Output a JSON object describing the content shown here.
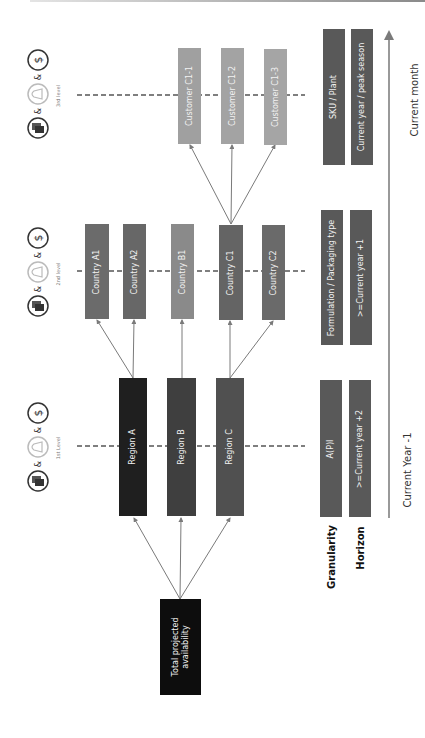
{
  "diagram": {
    "root": {
      "label": "Total projected availability",
      "color": "#0d0d0d"
    },
    "levels": [
      {
        "label": "1st Level",
        "icons": [
          "money-icon",
          "bell-icon",
          "containers-icon"
        ],
        "connector": "&"
      },
      {
        "label": "2nd level",
        "icons": [
          "money-icon",
          "bell-icon",
          "containers-icon"
        ],
        "connector": "&"
      },
      {
        "label": "3rd level",
        "icons": [
          "money-icon",
          "bell-icon",
          "containers-icon"
        ],
        "connector": "&"
      }
    ],
    "regions": [
      {
        "label": "Region A",
        "color": "#1f1f1f"
      },
      {
        "label": "Region B",
        "color": "#3f3f3f"
      },
      {
        "label": "Region C",
        "color": "#505050"
      }
    ],
    "countries": [
      {
        "label": "Country A1",
        "color": "#6b6b6b"
      },
      {
        "label": "Country A2",
        "color": "#676767"
      },
      {
        "label": "Country B1",
        "color": "#8a8a8a"
      },
      {
        "label": "Country C1",
        "color": "#646464"
      },
      {
        "label": "Country C2",
        "color": "#6a6a6a"
      }
    ],
    "customers": [
      {
        "label": "Customer C1-1",
        "color": "#a0a0a0"
      },
      {
        "label": "Customer C1-2",
        "color": "#a3a3a3"
      },
      {
        "label": "Customer C1-3",
        "color": "#a5a5a5"
      }
    ]
  },
  "side": {
    "granularity_title": "Granularity",
    "horizon_title": "Horizon",
    "granularity": [
      "A(P)I",
      "Formulation / Packaging type",
      "SKU / Plant"
    ],
    "horizon": [
      ">=Current year +2",
      ">=Current year +1",
      "Current year / peak season"
    ],
    "bar_color": "#595959"
  },
  "timeline": {
    "start_label": "Current Year -1",
    "end_label": "Current month"
  },
  "symbols": {
    "amp": "&",
    "dollar": "$"
  }
}
